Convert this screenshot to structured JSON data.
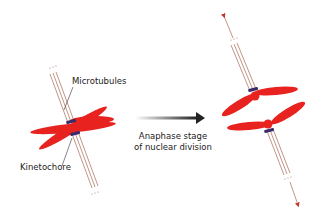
{
  "diagram": {
    "left_cell": {
      "labels": {
        "microtubules": "Microtubules",
        "kinetochore": "Kinetochore"
      }
    },
    "transition": {
      "caption_line1": "Anaphase stage",
      "caption_line2": "of nuclear division"
    },
    "colors": {
      "chromosome": "#e8231f",
      "microtubule": "#b07a6a",
      "kinetochore": "#3a2a6a",
      "arrow": "#333333"
    }
  }
}
